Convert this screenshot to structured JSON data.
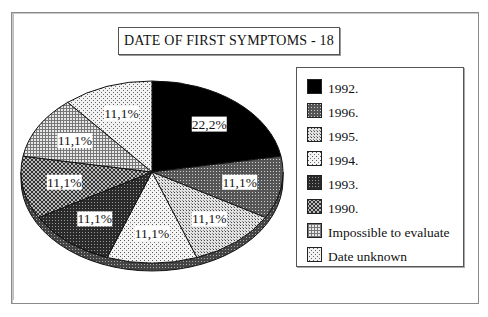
{
  "chart_data": {
    "type": "pie",
    "title": "DATE OF FIRST SYMPTOMS - 18",
    "categories": [
      "1992.",
      "1996.",
      "1995.",
      "1994.",
      "1993.",
      "1990.",
      "Impossible to evaluate",
      "Date unknown"
    ],
    "values": [
      22.2,
      11.1,
      11.1,
      11.1,
      11.1,
      11.1,
      11.1,
      11.1
    ],
    "data_labels": [
      "22,2%",
      "11,1%",
      "11,1%",
      "11,1%",
      "11,1%",
      "11,1%",
      "11,1%",
      "11,1%"
    ],
    "start_angle": "12 o'clock",
    "direction": "clockwise",
    "style": "3D oblique pie, monochrome hatch patterns",
    "legend_position": "right"
  },
  "legend": {
    "items": [
      {
        "label": "1992.",
        "pattern": "solid-black"
      },
      {
        "label": "1996.",
        "pattern": "dense-dark-dots"
      },
      {
        "label": "1995.",
        "pattern": "light-grid-dots"
      },
      {
        "label": "1994.",
        "pattern": "sparse-dots"
      },
      {
        "label": "1993.",
        "pattern": "dark-checker"
      },
      {
        "label": "1990.",
        "pattern": "crosshatch"
      },
      {
        "label": "Impossible to evaluate",
        "pattern": "fine-grid"
      },
      {
        "label": "Date unknown",
        "pattern": "light-speckle"
      }
    ]
  },
  "colors": {
    "background": "#ffffff",
    "border": "#555555",
    "ink": "#111111"
  }
}
